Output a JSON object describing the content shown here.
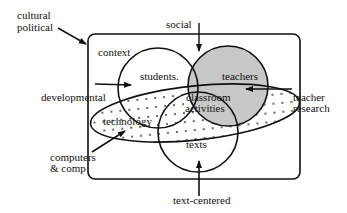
{
  "diagram": {
    "type": "venn",
    "frame_label": "context",
    "circles": [
      {
        "id": "students",
        "label": "students."
      },
      {
        "id": "teachers",
        "label": "teachers",
        "fill": "#c8c8c8"
      },
      {
        "id": "texts",
        "label": "texts"
      }
    ],
    "center_label_line1": "classroom",
    "center_label_line2": "activities",
    "ellipse_label": "technology",
    "dotted_region_label": "developmental",
    "external_influences": [
      {
        "id": "cultural",
        "line1": "cultural",
        "line2": "political"
      },
      {
        "id": "social",
        "line1": "social"
      },
      {
        "id": "developmental",
        "line1": "developmental"
      },
      {
        "id": "teacher-research",
        "line1": "teacher",
        "line2": "research"
      },
      {
        "id": "computers",
        "line1": "computers",
        "line2": "& comp"
      },
      {
        "id": "text-centered",
        "line1": "text-centered"
      }
    ],
    "colors": {
      "stroke": "#111111",
      "teachers_fill": "#c8c8c8",
      "background": "#ffffff"
    }
  }
}
